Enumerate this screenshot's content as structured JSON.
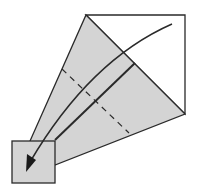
{
  "diagram": {
    "type": "origami-fold-step",
    "colors": {
      "paper_back": "#ffffff",
      "paper_colored": "#d4d4d4",
      "line": "#2a2a2a"
    },
    "elements": {
      "white_square": "unfolded square corner",
      "gray_flap": "folded colored flap",
      "small_square": "folded tip square",
      "valley_fold_line": "dashed",
      "fold_edge_line": "solid",
      "fold_arrow": "curved arrow pointing to bottom-left"
    }
  }
}
